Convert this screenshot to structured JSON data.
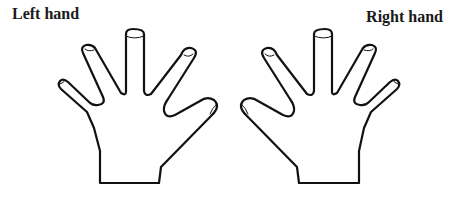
{
  "labels": {
    "left": "Left hand",
    "right": "Right hand"
  },
  "colors": {
    "outline": "#111111",
    "background": "#ffffff"
  }
}
